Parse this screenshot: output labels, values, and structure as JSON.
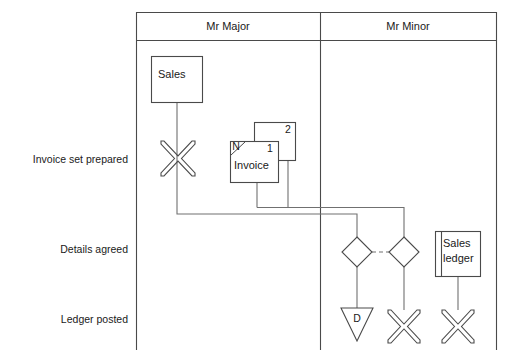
{
  "diagram": {
    "columns": [
      {
        "id": "mr-major",
        "label": "Mr Major"
      },
      {
        "id": "mr-minor",
        "label": "Mr Minor"
      }
    ],
    "row_labels": [
      {
        "id": "invoice-set-prepared",
        "label": "Invoice set prepared"
      },
      {
        "id": "details-agreed",
        "label": "Details agreed"
      },
      {
        "id": "ledger-posted",
        "label": "Ledger posted"
      }
    ],
    "nodes": {
      "sales_box": {
        "label": "Sales"
      },
      "invoice_set": {
        "front_label": "Invoice",
        "front_copy_number": "1",
        "back_copy_number": "2",
        "corner_marker": "N"
      },
      "sales_ledger": {
        "label_line1": "Sales",
        "label_line2": "ledger"
      },
      "file_triangle": {
        "label": "D"
      }
    },
    "terminators": [
      {
        "id": "terminator-sales-copy",
        "glyph": "X",
        "column": "mr-major"
      },
      {
        "id": "terminator-invoice-copy",
        "glyph": "X",
        "column": "mr-minor"
      },
      {
        "id": "terminator-sales-ledger",
        "glyph": "X",
        "column": "mr-minor"
      }
    ],
    "connector_style": {
      "dashed_link_note": "dashed link between the two agreement diamonds"
    },
    "colors": {
      "line": "#4a4a4a",
      "connector": "#707070",
      "text": "#1a1a1a",
      "background": "#ffffff"
    }
  }
}
